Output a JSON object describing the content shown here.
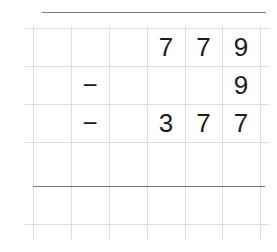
{
  "worksheet": {
    "type": "column-subtraction",
    "colors": {
      "grid": "#dedede",
      "rule": "#7d7d7d",
      "digit": "#1c1c1c",
      "background": "#ffffff"
    },
    "rows": [
      {
        "id": "row-minuend",
        "operator": "",
        "digits": [
          "",
          "7",
          "7",
          "9"
        ],
        "number": "779"
      },
      {
        "id": "row-subtrahend-1",
        "operator": "−",
        "digits": [
          "",
          "",
          "",
          "9"
        ],
        "number": "9"
      },
      {
        "id": "row-subtrahend-2",
        "operator": "−",
        "digits": [
          "",
          "3",
          "7",
          "7"
        ],
        "number": "377"
      },
      {
        "id": "row-blank",
        "operator": "",
        "digits": [
          "",
          "",
          "",
          ""
        ],
        "number": ""
      },
      {
        "id": "row-answer",
        "operator": "",
        "digits": [
          "",
          "",
          "",
          ""
        ],
        "number": ""
      }
    ]
  }
}
